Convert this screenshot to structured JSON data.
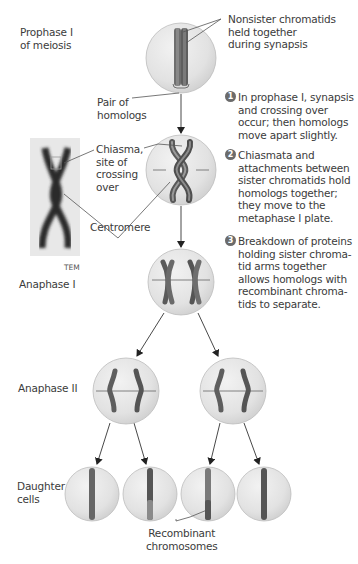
{
  "stages": {
    "prophase": "Prophase I\nof meiosis",
    "anaphase1": "Anaphase I",
    "anaphase2": "Anaphase II",
    "daughter": "Daughter\ncells"
  },
  "callouts": {
    "nonsister": "Nonsister chromatids\nheld together\nduring synapsis",
    "pair_of_homologs": "Pair of\nhomologs",
    "chiasma": "Chiasma,\nsite of\ncrossing\nover",
    "centromere": "Centromere",
    "recombinant": "Recombinant\nchromosomes",
    "tem": "TEM"
  },
  "steps": [
    {
      "num": "1",
      "text": "In prophase I, synapsis\nand crossing over\noccur; then homologs\nmove apart slightly."
    },
    {
      "num": "2",
      "text": "Chiasmata and\nattachments between\nsister chromatids hold\nhomologs together;\nthey move to the\nmetaphase I plate."
    },
    {
      "num": "3",
      "text": "Breakdown of proteins\nholding sister chroma-\ntid arms together\nallows homologs with\nrecombinant chroma-\ntids to separate."
    }
  ],
  "colors": {
    "cell_fill": "#e4e4e4",
    "cell_stroke": "#b5b5b5",
    "chromosome_dark": "#5a5a5a",
    "chromosome_light": "#8a8a8a",
    "arrow": "#333333",
    "leader": "#555555"
  }
}
